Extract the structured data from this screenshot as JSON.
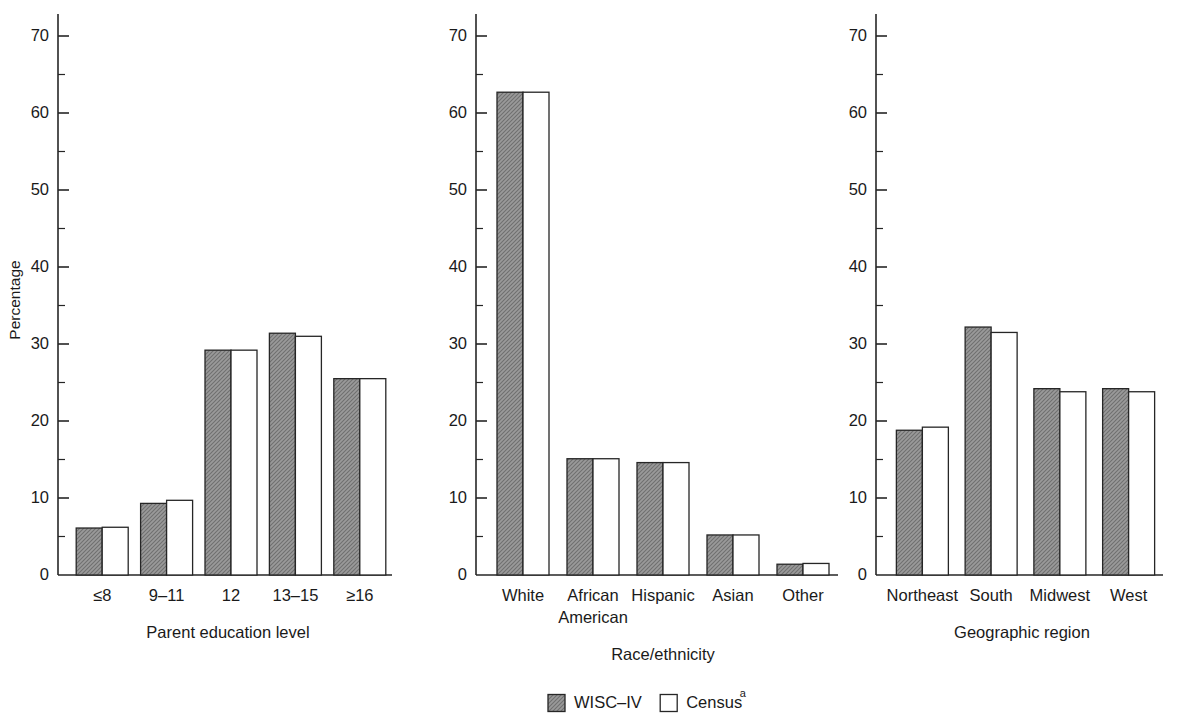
{
  "figure": {
    "background_color": "#ffffff",
    "series_colors": {
      "wisc": "#8a8a8a",
      "census": "#ffffff",
      "outline": "#262626"
    }
  },
  "legend": {
    "position": "bottom-center",
    "entries": [
      {
        "label": "WISC–IV",
        "swatch": "filled-gray-swatch",
        "superscript": ""
      },
      {
        "label": "Census",
        "swatch": "open-white-swatch",
        "superscript": "a"
      }
    ]
  },
  "chart_data": [
    {
      "type": "bar",
      "title": "",
      "xlabel": "Parent education level",
      "ylabel": "Percentage",
      "categories": [
        "≤8",
        "9–11",
        "12",
        "13–15",
        "≥16"
      ],
      "series": [
        {
          "name": "WISC–IV",
          "values": [
            6.1,
            9.3,
            29.2,
            31.4,
            25.5
          ]
        },
        {
          "name": "Census",
          "values": [
            6.2,
            9.7,
            29.2,
            31.0,
            25.5
          ]
        }
      ],
      "ylim": [
        0,
        72
      ],
      "yticks": [
        0,
        10,
        20,
        30,
        40,
        50,
        60,
        70
      ],
      "ytick_labels": [
        "0",
        "10",
        "20",
        "30",
        "40",
        "50",
        "60",
        "70"
      ],
      "minor_ticks": true,
      "grid": false
    },
    {
      "type": "bar",
      "title": "",
      "xlabel": "Race/ethnicity",
      "ylabel": "",
      "categories": [
        "White",
        "African\nAmerican",
        "Hispanic",
        "Asian",
        "Other"
      ],
      "series": [
        {
          "name": "WISC–IV",
          "values": [
            62.7,
            15.1,
            14.6,
            5.2,
            1.4
          ]
        },
        {
          "name": "Census",
          "values": [
            62.7,
            15.1,
            14.6,
            5.2,
            1.5
          ]
        }
      ],
      "ylim": [
        0,
        72
      ],
      "yticks": [
        0,
        10,
        20,
        30,
        40,
        50,
        60,
        70
      ],
      "ytick_labels": [
        "0",
        "10",
        "20",
        "30",
        "40",
        "50",
        "60",
        "70"
      ],
      "minor_ticks": true,
      "grid": false
    },
    {
      "type": "bar",
      "title": "",
      "xlabel": "Geographic region",
      "ylabel": "",
      "categories": [
        "Northeast",
        "South",
        "Midwest",
        "West"
      ],
      "series": [
        {
          "name": "WISC–IV",
          "values": [
            18.8,
            32.2,
            24.2,
            24.2
          ]
        },
        {
          "name": "Census",
          "values": [
            19.2,
            31.5,
            23.8,
            23.8
          ]
        }
      ],
      "ylim": [
        0,
        72
      ],
      "yticks": [
        0,
        10,
        20,
        30,
        40,
        50,
        60,
        70
      ],
      "ytick_labels": [
        "0",
        "10",
        "20",
        "30",
        "40",
        "50",
        "60",
        "70"
      ],
      "minor_ticks": true,
      "grid": false
    }
  ]
}
